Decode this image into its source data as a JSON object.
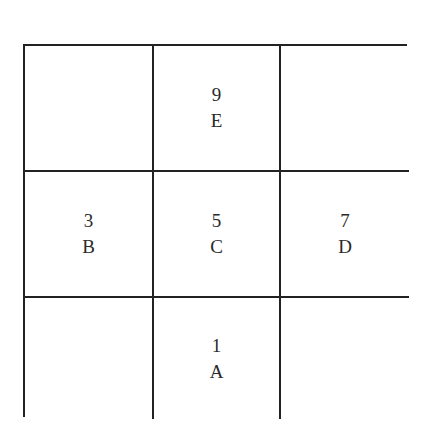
{
  "diagram": {
    "type": "3x3 grid",
    "cells": [
      [
        {
          "number": "",
          "letter": ""
        },
        {
          "number": "9",
          "letter": "E"
        },
        {
          "number": "",
          "letter": ""
        }
      ],
      [
        {
          "number": "3",
          "letter": "B"
        },
        {
          "number": "5",
          "letter": "C"
        },
        {
          "number": "7",
          "letter": "D"
        }
      ],
      [
        {
          "number": "",
          "letter": ""
        },
        {
          "number": "1",
          "letter": "A"
        },
        {
          "number": "",
          "letter": ""
        }
      ]
    ]
  },
  "colors": {
    "grid_line": "#222222",
    "text": "#2a2a2a",
    "background": "#ffffff"
  }
}
